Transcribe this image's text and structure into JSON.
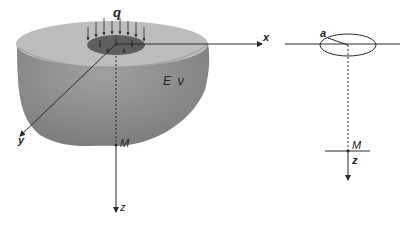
{
  "figure": {
    "left_panel": {
      "title": "Elastic half-space under uniform circular load",
      "labels": {
        "load": "q",
        "x_axis": "x",
        "y_axis": "y",
        "z_axis": "z",
        "material": "E  ν",
        "point": "M"
      }
    },
    "right_panel": {
      "title": "Plan schematic",
      "labels": {
        "radius": "a",
        "point": "M",
        "z_axis": "z"
      }
    },
    "colors": {
      "body_side": "#8f8f8f",
      "body_top": "#b9b9b9",
      "load_disk": "#5e5e5e",
      "lines": "#2a2a2a",
      "background": "#ffffff"
    }
  }
}
